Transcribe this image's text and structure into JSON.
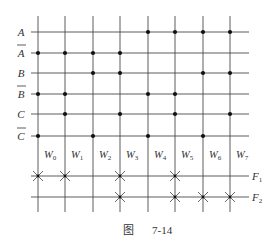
{
  "figure": {
    "caption_prefix": "图",
    "caption_number": "7-14"
  },
  "inputs": [
    {
      "label": "A",
      "bar": false,
      "y": 32,
      "dots": [
        4,
        5,
        6,
        7
      ]
    },
    {
      "label": "A",
      "bar": true,
      "y": 53,
      "dots": [
        0,
        1,
        2,
        3
      ]
    },
    {
      "label": "B",
      "bar": false,
      "y": 73,
      "dots": [
        2,
        3,
        6,
        7
      ]
    },
    {
      "label": "B",
      "bar": true,
      "y": 94,
      "dots": [
        0,
        1,
        4,
        5
      ]
    },
    {
      "label": "C",
      "bar": false,
      "y": 114,
      "dots": [
        1,
        3,
        5,
        7
      ]
    },
    {
      "label": "C",
      "bar": true,
      "y": 136,
      "dots": [
        0,
        2,
        4,
        6
      ]
    }
  ],
  "word_lines": [
    {
      "label": "W",
      "sub": "0",
      "x": 38
    },
    {
      "label": "W",
      "sub": "1",
      "x": 65
    },
    {
      "label": "W",
      "sub": "2",
      "x": 93
    },
    {
      "label": "W",
      "sub": "3",
      "x": 120
    },
    {
      "label": "W",
      "sub": "4",
      "x": 148
    },
    {
      "label": "W",
      "sub": "5",
      "x": 175
    },
    {
      "label": "W",
      "sub": "6",
      "x": 203
    },
    {
      "label": "W",
      "sub": "7",
      "x": 230
    }
  ],
  "outputs": [
    {
      "label": "F",
      "sub": "1",
      "y": 176,
      "crosses": [
        0,
        1,
        3,
        5
      ]
    },
    {
      "label": "F",
      "sub": "2",
      "y": 197,
      "crosses": [
        3,
        5,
        6,
        7
      ]
    }
  ],
  "colors": {
    "line": "#4a4a4a",
    "dot": "#111111",
    "text": "#333333"
  }
}
